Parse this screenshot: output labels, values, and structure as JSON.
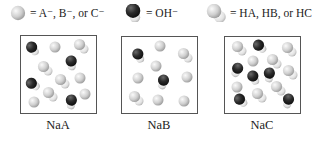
{
  "legend": [
    {
      "icon": "anion-sphere-icon",
      "text": "= A⁻, B⁻, or C⁻"
    },
    {
      "icon": "hydroxide-molecule-icon",
      "text": "= OH⁻"
    },
    {
      "icon": "acid-molecule-icon",
      "text": "= HA, HB, or HC"
    }
  ],
  "panels": [
    {
      "label": "NaA"
    },
    {
      "label": "NaB"
    },
    {
      "label": "NaC"
    }
  ],
  "colors": {
    "anion": "#c8c8c8",
    "oxygen": "#2e2e2e",
    "hydrogen": "#e6e6e6",
    "frame": "#555555"
  }
}
